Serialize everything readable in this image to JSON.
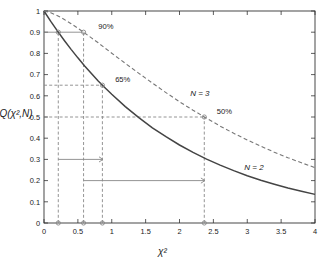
{
  "chart_data": {
    "type": "line",
    "title": "",
    "xlabel": "χ²",
    "ylabel": "Q(χ²,N)",
    "xlim": [
      0,
      4
    ],
    "ylim": [
      0,
      1
    ],
    "xticks": [
      0,
      0.5,
      1,
      1.5,
      2,
      2.5,
      3,
      3.5,
      4
    ],
    "xticklabels": [
      "0",
      "0.5",
      "1",
      "1.5",
      "2",
      "2.5",
      "3",
      "3.5",
      "4"
    ],
    "yticks": [
      0,
      0.1,
      0.2,
      0.3,
      0.4,
      0.5,
      0.6,
      0.7,
      0.8,
      0.9,
      1
    ],
    "yticklabels": [
      "0",
      "0.1",
      "0.2",
      "0.3",
      "0.4",
      "0.5",
      "0.6",
      "0.7",
      "0.8",
      "0.9",
      "1"
    ],
    "grid": false,
    "legend": "inline-curve-labels",
    "series": [
      {
        "name": "N = 2",
        "style": "solid",
        "color": "#444444",
        "x": [
          0,
          0.1,
          0.2,
          0.3,
          0.4,
          0.5,
          0.6,
          0.7,
          0.8,
          0.9,
          1.0,
          1.2,
          1.4,
          1.6,
          1.8,
          2.0,
          2.2,
          2.4,
          2.6,
          2.8,
          3.0,
          3.2,
          3.4,
          3.6,
          3.8,
          4.0
        ],
        "y": [
          1.0,
          0.951,
          0.905,
          0.861,
          0.819,
          0.779,
          0.741,
          0.705,
          0.67,
          0.638,
          0.607,
          0.549,
          0.497,
          0.449,
          0.407,
          0.368,
          0.333,
          0.301,
          0.273,
          0.247,
          0.223,
          0.202,
          0.183,
          0.165,
          0.15,
          0.135
        ]
      },
      {
        "name": "N = 3",
        "style": "dashed",
        "color": "#777777",
        "x": [
          0,
          0.1,
          0.2,
          0.3,
          0.4,
          0.5,
          0.6,
          0.7,
          0.8,
          0.9,
          1.0,
          1.2,
          1.4,
          1.6,
          1.8,
          2.0,
          2.2,
          2.4,
          2.6,
          2.8,
          3.0,
          3.2,
          3.4,
          3.6,
          3.8,
          4.0
        ],
        "y": [
          1.0,
          0.992,
          0.978,
          0.96,
          0.94,
          0.919,
          0.896,
          0.873,
          0.85,
          0.825,
          0.801,
          0.753,
          0.706,
          0.66,
          0.615,
          0.572,
          0.532,
          0.494,
          0.457,
          0.423,
          0.392,
          0.362,
          0.334,
          0.308,
          0.284,
          0.261
        ]
      }
    ],
    "curve_labels": [
      {
        "text": "N = 3",
        "x": 2.3,
        "y": 0.6
      },
      {
        "text": "N = 2",
        "x": 3.1,
        "y": 0.25
      }
    ],
    "annotations": [
      {
        "text": "90%",
        "level": 0.9,
        "x_text": 0.8,
        "y_text": 0.915,
        "x_solid": 0.211,
        "x_dashed": 0.584
      },
      {
        "text": "65%",
        "level": 0.65,
        "x_text": 1.05,
        "y_text": 0.663,
        "x_solid": 0.862,
        "x_dashed": null
      },
      {
        "text": "50%",
        "level": 0.5,
        "x_text": 2.55,
        "y_text": 0.513,
        "x_solid": 1.386,
        "x_dashed": 2.366
      }
    ],
    "reference_lines": [
      {
        "level": 0.9,
        "from_x": 0.0,
        "to_x": 0.584,
        "arrow": false,
        "style": "solid"
      },
      {
        "level": 0.65,
        "from_x": 0.0,
        "to_x": 0.862,
        "arrow": false,
        "style": "dashed"
      },
      {
        "level": 0.5,
        "from_x": 0.0,
        "to_x": 2.366,
        "arrow": false,
        "style": "dashed"
      },
      {
        "level": 0.3,
        "from_x": 0.211,
        "to_x": 0.862,
        "arrow": true,
        "style": "solid"
      },
      {
        "level": 0.2,
        "from_x": 0.584,
        "to_x": 2.366,
        "arrow": true,
        "style": "solid"
      }
    ],
    "vertical_droplines": [
      {
        "x": 0.211,
        "from_y": 0.0,
        "to_y": 0.9
      },
      {
        "x": 0.584,
        "from_y": 0.0,
        "to_y": 0.9
      },
      {
        "x": 0.862,
        "from_y": 0.0,
        "to_y": 0.65
      },
      {
        "x": 2.366,
        "from_y": 0.0,
        "to_y": 0.5
      }
    ],
    "x_axis_markers": [
      0.211,
      0.584,
      0.862,
      2.366
    ],
    "curve_markers": [
      {
        "x": 0.211,
        "y": 0.9
      },
      {
        "x": 0.584,
        "y": 0.9
      },
      {
        "x": 0.862,
        "y": 0.65
      },
      {
        "x": 2.366,
        "y": 0.5
      }
    ]
  },
  "colors": {
    "solid_curve": "#444444",
    "dashed_curve": "#777777",
    "annotation": "#888888",
    "axis": "#333333",
    "background": "#ffffff"
  }
}
